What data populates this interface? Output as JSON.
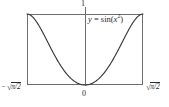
{
  "figure": {
    "background_color": "#ffffff",
    "line_color": "#3a3a3a",
    "frame_color": "#6e6e6e",
    "text_color": "#2b2b2b"
  },
  "labels": {
    "y_max": "1",
    "origin": "0",
    "x_min_minus": "−",
    "x_min_radicand": "π/2",
    "x_max_radicand": "π/2",
    "radical_sign": "√",
    "equation_lhs": "y",
    "equation_equals": "=",
    "equation_fn": "sin",
    "equation_open": "(",
    "equation_var": "x",
    "equation_power": "2",
    "equation_close": ")",
    "equation_full": "y = sin(x²)"
  },
  "chart_data": {
    "type": "line",
    "title": "",
    "subtitle": "",
    "xlabel": "",
    "ylabel": "",
    "function": "y = sin(x^2)",
    "xlim": [
      -1.2533141373155003,
      1.2533141373155003
    ],
    "ylim": [
      0,
      1
    ],
    "xtick_labels": [
      "−√(π/2)",
      "0",
      "√(π/2)"
    ],
    "xtick_values": [
      -1.2533141373155003,
      0,
      1.2533141373155003
    ],
    "ytick_labels": [
      "1"
    ],
    "ytick_values": [
      1
    ],
    "grid": false,
    "legend": "none",
    "annotations": [
      {
        "text": "y = sin(x²)",
        "x": 0.45,
        "y": 0.93,
        "style": "italic"
      }
    ],
    "series": [
      {
        "name": "y = sin(x^2)",
        "color": "#3a3a3a",
        "x": [
          -1.2533141373155003,
          -1.2219212838576128,
          -1.1905284304,
          -1.1591355769,
          -1.1277427234,
          -1.09634987,
          -1.0649570165,
          -1.033564163,
          -1.0021713096,
          -0.9707784561,
          -0.9393856026,
          -0.9079927492,
          -0.8765998957,
          -0.8452070422,
          -0.8138141888,
          -0.7824213353,
          -0.7510284818,
          -0.7196356284,
          -0.6882427749,
          -0.6568499214,
          -0.625457068,
          -0.5940642145,
          -0.562671361,
          -0.5312785076,
          -0.4998856541,
          -0.4684928006,
          -0.4370999472,
          -0.4057070937,
          -0.3743142402,
          -0.3429213868,
          -0.3115285333,
          -0.2801356798,
          -0.2487428264,
          -0.2173499729,
          -0.1859571194,
          -0.154564266,
          -0.1231714125,
          -0.091778559,
          -0.0603857056,
          -0.0289928521,
          0.0,
          0.0289928521,
          0.0603857056,
          0.091778559,
          0.1231714125,
          0.154564266,
          0.1859571194,
          0.2173499729,
          0.2487428264,
          0.2801356798,
          0.3115285333,
          0.3429213868,
          0.3743142402,
          0.4057070937,
          0.4370999472,
          0.4684928006,
          0.4998856541,
          0.5312785076,
          0.562671361,
          0.5940642145,
          0.625457068,
          0.6568499214,
          0.6882427749,
          0.7196356284,
          0.7510284818,
          0.7824213353,
          0.8138141888,
          0.8452070422,
          0.8765998957,
          0.9079927492,
          0.9393856026,
          0.9707784561,
          1.0021713096,
          1.033564163,
          1.0649570165,
          1.09634987,
          1.1277427234,
          1.1591355769,
          1.1905284304,
          1.2219212838576128,
          1.2533141373155003
        ],
        "y": [
          1.0,
          0.9997,
          0.99654,
          0.98866,
          0.97501,
          0.95495,
          0.92815,
          0.89453,
          0.85421,
          0.80752,
          0.75494,
          0.69707,
          0.63463,
          0.5684,
          0.49923,
          0.428,
          0.35561,
          0.28293,
          0.21083,
          0.14012,
          0.07158,
          0.00593,
          -0.05617,
          0.11413,
          0.21843,
          0.21374,
          0.18797,
          0.16148,
          0.13796,
          0.11647,
          0.09625,
          0.07793,
          0.06172,
          0.04713,
          0.0345,
          0.02384,
          0.01516,
          0.00842,
          0.00365,
          0.00084,
          0.0,
          0.00084,
          0.00365,
          0.00842,
          0.01516,
          0.02384,
          0.0345,
          0.04713,
          0.06172,
          0.07793,
          0.09625,
          0.11647,
          0.13796,
          0.16148,
          0.18797,
          0.21374,
          0.24614,
          0.27856,
          0.31255,
          0.34793,
          0.38446,
          0.42186,
          0.4598,
          0.49793,
          0.53586,
          0.5732,
          0.60954,
          0.64448,
          0.67761,
          0.70857,
          0.73699,
          0.76256,
          0.785,
          0.80408,
          0.81962,
          0.8315,
          0.83966,
          0.84411,
          0.8449,
          0.84217,
          1.0
        ],
        "note": "Curve is the even function sin(x^2) on [-sqrt(pi/2), sqrt(pi/2)]; it equals 0 at x=0 and rises to 1 at both endpoints."
      }
    ]
  }
}
